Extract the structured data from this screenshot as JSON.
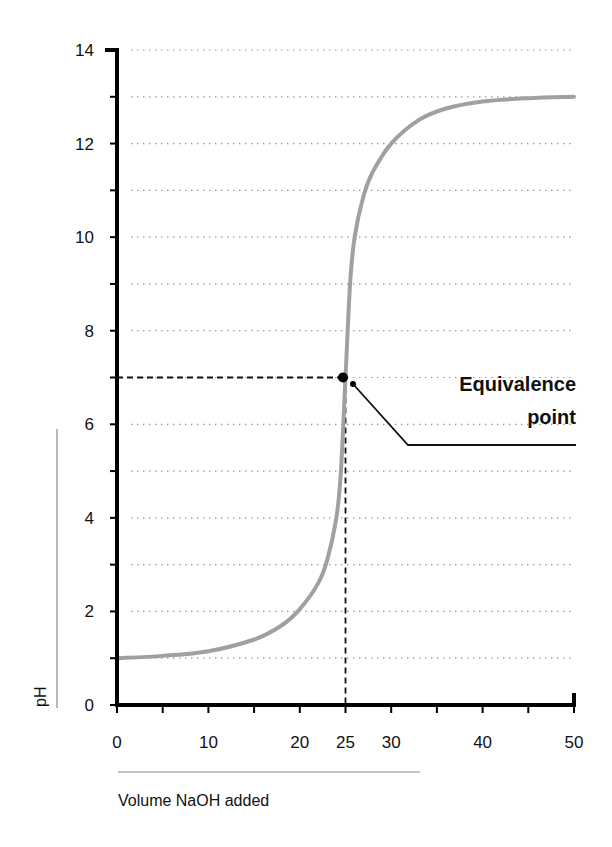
{
  "chart_data": {
    "type": "line",
    "title": "",
    "xlabel": "Volume NaOH added",
    "ylabel": "pH",
    "xlim": [
      0,
      50
    ],
    "ylim": [
      0,
      14
    ],
    "x_ticks": [
      0,
      10,
      20,
      25,
      30,
      40,
      50
    ],
    "x_minor_ticks": [
      5,
      15,
      35,
      45
    ],
    "y_ticks": [
      0,
      2,
      4,
      6,
      8,
      10,
      12,
      14
    ],
    "y_minor_ticks": [
      1,
      3,
      5,
      7,
      9,
      11,
      13
    ],
    "grid": "horizontal dotted at every 1 pH unit",
    "series": [
      {
        "name": "Titration curve",
        "color": "#a0a0a0",
        "x": [
          0,
          5,
          10,
          15,
          18,
          20,
          22,
          23,
          24,
          24.5,
          25,
          25.5,
          26,
          27,
          28,
          30,
          33,
          36,
          40,
          45,
          50
        ],
        "values": [
          1.0,
          1.05,
          1.15,
          1.4,
          1.7,
          2.05,
          2.6,
          3.1,
          4.0,
          5.0,
          7.0,
          9.0,
          10.0,
          10.9,
          11.4,
          12.0,
          12.5,
          12.75,
          12.9,
          12.97,
          13.0
        ]
      }
    ],
    "annotations": [
      {
        "text": "Equivalence point",
        "x": 25,
        "y": 7,
        "style": "dashed guide lines to both axes, black dot marker"
      }
    ]
  },
  "labels": {
    "y_tick_labels": [
      "0",
      "2",
      "4",
      "6",
      "8",
      "10",
      "12",
      "14"
    ],
    "x_tick_labels": [
      "0",
      "10",
      "20",
      "25",
      "30",
      "40",
      "50"
    ],
    "ylabel": "pH",
    "xlabel": "Volume NaOH added",
    "annotation_line1": "Equivalence",
    "annotation_line2": "point"
  }
}
